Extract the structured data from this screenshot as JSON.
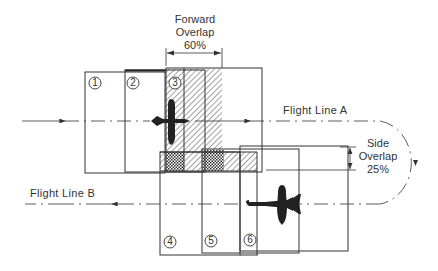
{
  "forward_overlap": {
    "line1": "Forward",
    "line2": "Overlap",
    "value": "60%"
  },
  "side_overlap": {
    "line1": "Side",
    "line2": "Overlap",
    "value": "25%"
  },
  "flight_lines": [
    {
      "label": "Flight Line A",
      "direction": "left-to-right"
    },
    {
      "label": "Flight Line B",
      "direction": "right-to-left"
    }
  ],
  "frames": [
    {
      "number": "1",
      "line": "A"
    },
    {
      "number": "2",
      "line": "A"
    },
    {
      "number": "3",
      "line": "A"
    },
    {
      "number": "4",
      "line": "B"
    },
    {
      "number": "5",
      "line": "B"
    },
    {
      "number": "6",
      "line": "B"
    }
  ],
  "colors": {
    "line": "#333333",
    "aircraft": "#222222",
    "background": "#ffffff"
  }
}
